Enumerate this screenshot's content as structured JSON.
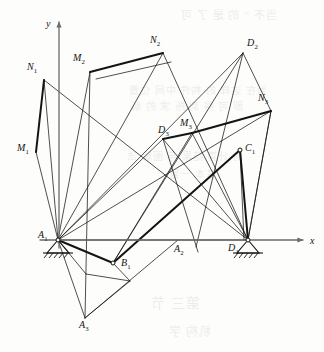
{
  "figure": {
    "width": 324,
    "height": 352,
    "background_color": "#fdfdfb",
    "ink_color": "#141414",
    "axis_color": "#6b6b6b"
  },
  "axes": {
    "origin": {
      "x": 59,
      "y": 240
    },
    "x_axis": {
      "label": "x",
      "label_pos": {
        "x": 310,
        "y": 235
      },
      "from": {
        "x": 40,
        "y": 240
      },
      "to": {
        "x": 303,
        "y": 240
      },
      "arrow": true
    },
    "y_axis": {
      "label": "y",
      "label_pos": {
        "x": 46,
        "y": 18
      },
      "from": {
        "x": 59,
        "y": 248
      },
      "to": {
        "x": 59,
        "y": 22
      },
      "arrow": true
    }
  },
  "points": [
    {
      "id": "N1",
      "base": "N",
      "sub": "1",
      "x": 44,
      "y": 80,
      "label_x": 27,
      "label_y": 62,
      "marker": false
    },
    {
      "id": "M1",
      "base": "M",
      "sub": "1",
      "x": 36,
      "y": 152,
      "label_x": 17,
      "label_y": 143,
      "marker": false
    },
    {
      "id": "M2",
      "base": "M",
      "sub": "2",
      "x": 90,
      "y": 72,
      "label_x": 73,
      "label_y": 53,
      "marker": false
    },
    {
      "id": "N2",
      "base": "N",
      "sub": "2",
      "x": 163,
      "y": 53,
      "label_x": 150,
      "label_y": 35,
      "marker": false
    },
    {
      "id": "D2",
      "base": "D",
      "sub": "2",
      "x": 243,
      "y": 53,
      "label_x": 247,
      "label_y": 38,
      "marker": false
    },
    {
      "id": "N3",
      "base": "N",
      "sub": "3",
      "x": 271,
      "y": 111,
      "label_x": 258,
      "label_y": 93,
      "marker": false
    },
    {
      "id": "D3",
      "base": "D",
      "sub": "3",
      "x": 163,
      "y": 139,
      "label_x": 158,
      "label_y": 125,
      "marker": false
    },
    {
      "id": "M3",
      "base": "M",
      "sub": "3",
      "x": 192,
      "y": 133,
      "label_x": 180,
      "label_y": 118,
      "marker": false
    },
    {
      "id": "C1",
      "base": "C",
      "sub": "1",
      "x": 240,
      "y": 150,
      "label_x": 245,
      "label_y": 143,
      "marker": true
    },
    {
      "id": "A1",
      "base": "A",
      "sub": "1",
      "x": 58,
      "y": 240,
      "label_x": 38,
      "label_y": 230,
      "marker": true
    },
    {
      "id": "B1",
      "base": "B",
      "sub": "1",
      "x": 113,
      "y": 263,
      "label_x": 121,
      "label_y": 258,
      "marker": true
    },
    {
      "id": "A2",
      "base": "A",
      "sub": "2",
      "x": 178,
      "y": 240,
      "label_x": 174,
      "label_y": 244,
      "marker": false
    },
    {
      "id": "D1",
      "base": "D",
      "sub": "1",
      "x": 248,
      "y": 240,
      "label_x": 228,
      "label_y": 243,
      "marker": true
    },
    {
      "id": "A3",
      "base": "A",
      "sub": "3",
      "x": 85,
      "y": 318,
      "label_x": 79,
      "label_y": 320,
      "marker": false
    }
  ],
  "thick_links": [
    {
      "name": "link-N1-M1",
      "from": {
        "x": 44,
        "y": 80
      },
      "to": {
        "x": 36,
        "y": 152
      }
    },
    {
      "name": "link-M2-N2",
      "from": {
        "x": 90,
        "y": 72
      },
      "to": {
        "x": 163,
        "y": 53
      }
    },
    {
      "name": "link-D3-M3",
      "from": {
        "x": 163,
        "y": 139
      },
      "to": {
        "x": 192,
        "y": 133
      }
    },
    {
      "name": "link-M3-N3",
      "from": {
        "x": 192,
        "y": 133
      },
      "to": {
        "x": 271,
        "y": 111
      }
    },
    {
      "name": "link-A1-B1",
      "from": {
        "x": 58,
        "y": 240
      },
      "to": {
        "x": 113,
        "y": 263
      }
    },
    {
      "name": "link-B1-C1",
      "from": {
        "x": 113,
        "y": 263
      },
      "to": {
        "x": 240,
        "y": 150
      }
    },
    {
      "name": "link-C1-D1",
      "from": {
        "x": 240,
        "y": 150
      },
      "to": {
        "x": 248,
        "y": 240
      }
    }
  ],
  "thin_lines": [
    {
      "name": "line-N1-A1",
      "from": {
        "x": 44,
        "y": 80
      },
      "to": {
        "x": 58,
        "y": 240
      }
    },
    {
      "name": "line-M1-A1",
      "from": {
        "x": 36,
        "y": 152
      },
      "to": {
        "x": 58,
        "y": 240
      }
    },
    {
      "name": "line-N1-D1",
      "from": {
        "x": 44,
        "y": 80
      },
      "to": {
        "x": 248,
        "y": 240
      }
    },
    {
      "name": "line-M2-A1",
      "from": {
        "x": 90,
        "y": 72
      },
      "to": {
        "x": 58,
        "y": 240
      }
    },
    {
      "name": "line-M2-A3",
      "from": {
        "x": 90,
        "y": 72
      },
      "to": {
        "x": 85,
        "y": 318
      }
    },
    {
      "name": "line-N2-D1",
      "from": {
        "x": 163,
        "y": 53
      },
      "to": {
        "x": 248,
        "y": 240
      }
    },
    {
      "name": "line-N2-M2b",
      "from": {
        "x": 171,
        "y": 62
      },
      "to": {
        "x": 96,
        "y": 79
      }
    },
    {
      "name": "line-D2-A1",
      "from": {
        "x": 243,
        "y": 53
      },
      "to": {
        "x": 58,
        "y": 240
      }
    },
    {
      "name": "line-D2-B1",
      "from": {
        "x": 243,
        "y": 53
      },
      "to": {
        "x": 113,
        "y": 263
      }
    },
    {
      "name": "line-D2-down",
      "from": {
        "x": 243,
        "y": 53
      },
      "to": {
        "x": 196,
        "y": 247
      }
    },
    {
      "name": "line-N3-D1",
      "from": {
        "x": 271,
        "y": 111
      },
      "to": {
        "x": 248,
        "y": 240
      }
    },
    {
      "name": "line-N3-A1",
      "from": {
        "x": 271,
        "y": 111
      },
      "to": {
        "x": 58,
        "y": 240
      }
    },
    {
      "name": "line-D3-A1",
      "from": {
        "x": 163,
        "y": 139
      },
      "to": {
        "x": 58,
        "y": 240
      }
    },
    {
      "name": "line-D3-down",
      "from": {
        "x": 163,
        "y": 139
      },
      "to": {
        "x": 198,
        "y": 252
      }
    },
    {
      "name": "line-M3-D1",
      "from": {
        "x": 192,
        "y": 133
      },
      "to": {
        "x": 248,
        "y": 240
      }
    },
    {
      "name": "line-C1-D1b",
      "from": {
        "x": 240,
        "y": 150
      },
      "to": {
        "x": 244,
        "y": 240
      }
    },
    {
      "name": "line-A1-A3",
      "from": {
        "x": 58,
        "y": 240
      },
      "to": {
        "x": 85,
        "y": 318
      }
    },
    {
      "name": "line-A1-N2",
      "from": {
        "x": 58,
        "y": 240
      },
      "to": {
        "x": 163,
        "y": 53
      }
    },
    {
      "name": "line-A3-A2",
      "from": {
        "x": 85,
        "y": 318
      },
      "to": {
        "x": 178,
        "y": 240
      }
    },
    {
      "name": "line-A3-up",
      "from": {
        "x": 85,
        "y": 318
      },
      "to": {
        "x": 130,
        "y": 281
      }
    },
    {
      "name": "line-B1-fan",
      "from": {
        "x": 113,
        "y": 263
      },
      "to": {
        "x": 130,
        "y": 281
      }
    },
    {
      "name": "line-A1-fan2",
      "from": {
        "x": 58,
        "y": 240
      },
      "to": {
        "x": 86,
        "y": 274
      }
    },
    {
      "name": "line-fan2-b",
      "from": {
        "x": 86,
        "y": 274
      },
      "to": {
        "x": 130,
        "y": 281
      }
    },
    {
      "name": "line-A1-D1",
      "from": {
        "x": 58,
        "y": 240
      },
      "to": {
        "x": 248,
        "y": 240
      }
    },
    {
      "name": "line-D2-N3e",
      "from": {
        "x": 243,
        "y": 53
      },
      "to": {
        "x": 271,
        "y": 111
      }
    },
    {
      "name": "line-N3-C1e",
      "from": {
        "x": 271,
        "y": 111
      },
      "to": {
        "x": 248,
        "y": 240
      }
    },
    {
      "name": "line-M3-A1b",
      "from": {
        "x": 192,
        "y": 133
      },
      "to": {
        "x": 113,
        "y": 263
      }
    },
    {
      "name": "line-D3-D1b",
      "from": {
        "x": 163,
        "y": 139
      },
      "to": {
        "x": 248,
        "y": 240
      }
    }
  ],
  "ground_supports": [
    {
      "name": "ground-support-A1",
      "pivot": {
        "x": 58,
        "y": 240
      },
      "tri_half_width": 11,
      "tri_height": 13,
      "hatch_count": 5
    },
    {
      "name": "ground-support-D1",
      "pivot": {
        "x": 248,
        "y": 240
      },
      "tri_half_width": 11,
      "tri_height": 13,
      "hatch_count": 5
    }
  ],
  "bleed_through_text": [
    {
      "text": "当不 ” 的 是 了 可",
      "x": 180,
      "y": 6,
      "size": 11
    },
    {
      "text": "为在 这样 的 构件 中间 位置",
      "x": 128,
      "y": 82,
      "size": 10
    },
    {
      "text": "即 可 得 到 所 求 的 解",
      "x": 130,
      "y": 98,
      "size": 10
    },
    {
      "text": "的 计算 结果 与 图解 法",
      "x": 126,
      "y": 148,
      "size": 10
    },
    {
      "text": "基本 一致",
      "x": 168,
      "y": 166,
      "size": 10
    },
    {
      "text": "第三 节",
      "x": 150,
      "y": 292,
      "size": 14
    },
    {
      "text": "机构 学",
      "x": 168,
      "y": 322,
      "size": 12
    }
  ]
}
